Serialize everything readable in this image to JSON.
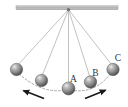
{
  "figure": {
    "width": 128,
    "height": 107,
    "background_color": "#ffffff"
  },
  "support_bar": {
    "name": "horizontal support bar",
    "x1": 16,
    "y1": 7.5,
    "x2": 118,
    "y2": 7.5,
    "thickness": 4,
    "color": "#b6b6b6",
    "edge_color": "#8f8f8f"
  },
  "pivot": {
    "name": "pivot point",
    "x": 68.5,
    "y": 9.5,
    "color": "#6f6f6f",
    "radius": 1.6
  },
  "strings": {
    "color": "#a8a8a8",
    "width": 0.7,
    "count": 5
  },
  "arc": {
    "name": "dashed swing arc",
    "color": "#9c9c9c",
    "width": 0.8,
    "dash": "2 2",
    "path": "M 16,71 Q 42,96 68.5,89.5 Q 95,96 113,70.5"
  },
  "balls": [
    {
      "id": "ball-far-left",
      "label": "",
      "cx": 16.5,
      "cy": 69.5,
      "r": 6.2,
      "label_x": 0,
      "label_y": 0
    },
    {
      "id": "ball-left",
      "label": "",
      "cx": 41.5,
      "cy": 80.5,
      "r": 6.2,
      "label_x": 0,
      "label_y": 0
    },
    {
      "id": "ball-center-a",
      "label": "A",
      "cx": 68.5,
      "cy": 88.5,
      "r": 6.5,
      "label_x": 73.5,
      "label_y": 81.5
    },
    {
      "id": "ball-right-b",
      "label": "B",
      "cx": 90.5,
      "cy": 82.0,
      "r": 6.2,
      "label_x": 95.5,
      "label_y": 76.0
    },
    {
      "id": "ball-far-right-c",
      "label": "C",
      "cx": 113.0,
      "cy": 69.5,
      "r": 6.2,
      "label_x": 118.0,
      "label_y": 61.0
    }
  ],
  "ball_style": {
    "highlight_color": "#e8e8e8",
    "mid_color": "#9a9a9a",
    "shadow_color": "#4a4a4a",
    "outline_color": "#555555"
  },
  "arrows": [
    {
      "id": "arrow-left",
      "direction": "up-left",
      "color": "#1a1a1a",
      "x1": 44.0,
      "y1": 98.5,
      "x2": 22.0,
      "y2": 90.0,
      "width": 1.6
    },
    {
      "id": "arrow-right",
      "direction": "up-right",
      "color": "#1a1a1a",
      "x1": 85.0,
      "y1": 98.5,
      "x2": 107.0,
      "y2": 89.5,
      "width": 1.6
    }
  ],
  "labels": {
    "a": "A",
    "b": "B",
    "c": "C"
  }
}
